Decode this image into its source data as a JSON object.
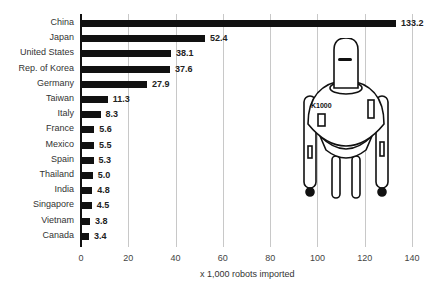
{
  "chart_data": {
    "type": "bar",
    "orientation": "horizontal",
    "title": "",
    "xlabel": "x 1,000 robots imported",
    "ylabel": "",
    "xlim": [
      0,
      140
    ],
    "xticks": [
      "0",
      "20",
      "40",
      "60",
      "80",
      "100",
      "120",
      "140"
    ],
    "grid": true,
    "categories": [
      "China",
      "Japan",
      "United States",
      "Rep. of Korea",
      "Germany",
      "Taiwan",
      "Italy",
      "France",
      "Mexico",
      "Spain",
      "Thailand",
      "India",
      "Singapore",
      "Vietnam",
      "Canada"
    ],
    "values": [
      133.2,
      52.4,
      38.1,
      37.6,
      27.9,
      11.3,
      8.3,
      5.6,
      5.5,
      5.3,
      5.0,
      4.8,
      4.5,
      3.8,
      3.4
    ],
    "value_labels": [
      "133.2",
      "52.4",
      "38.1",
      "37.6",
      "27.9",
      "11.3",
      "8.3",
      "5.6",
      "5.5",
      "5.3",
      "5.0",
      "4.8",
      "4.5",
      "3.8",
      "3.4"
    ],
    "annotations": [
      "K1000 robot illustration"
    ]
  },
  "illustration": {
    "robot_label": "K1000"
  }
}
